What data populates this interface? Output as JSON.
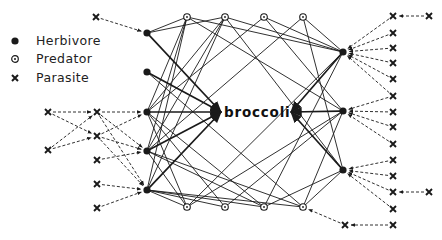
{
  "legend": {
    "items": [
      {
        "symbol": "filled-circle",
        "label": "Herbivore"
      },
      {
        "symbol": "circled-dot",
        "label": "Predator"
      },
      {
        "symbol": "cross",
        "label": "Parasite"
      }
    ]
  },
  "center": {
    "label": "broccoli",
    "x": 260,
    "y": 113
  },
  "colors": {
    "ink": "#1a1a1a",
    "background": "#ffffff"
  },
  "nodes": {
    "herbivores": [
      {
        "id": "H1",
        "x": 147,
        "y": 33
      },
      {
        "id": "H2",
        "x": 147,
        "y": 72
      },
      {
        "id": "H3",
        "x": 147,
        "y": 112
      },
      {
        "id": "H4",
        "x": 147,
        "y": 151
      },
      {
        "id": "H5",
        "x": 147,
        "y": 190
      },
      {
        "id": "H6",
        "x": 343,
        "y": 52
      },
      {
        "id": "H7",
        "x": 343,
        "y": 111
      },
      {
        "id": "H8",
        "x": 343,
        "y": 170
      }
    ],
    "predators": [
      {
        "id": "P1",
        "x": 187,
        "y": 17
      },
      {
        "id": "P2",
        "x": 225,
        "y": 17
      },
      {
        "id": "P3",
        "x": 264,
        "y": 17
      },
      {
        "id": "P4",
        "x": 303,
        "y": 17
      },
      {
        "id": "P5",
        "x": 187,
        "y": 207
      },
      {
        "id": "P6",
        "x": 225,
        "y": 207
      },
      {
        "id": "P7",
        "x": 264,
        "y": 207
      },
      {
        "id": "P8",
        "x": 303,
        "y": 207
      }
    ],
    "parasites": [
      {
        "id": "X1",
        "x": 96,
        "y": 17
      },
      {
        "id": "X2",
        "x": 48,
        "y": 112
      },
      {
        "id": "X3",
        "x": 97,
        "y": 112
      },
      {
        "id": "X4",
        "x": 48,
        "y": 150
      },
      {
        "id": "X5",
        "x": 97,
        "y": 136
      },
      {
        "id": "X6",
        "x": 97,
        "y": 160
      },
      {
        "id": "X7",
        "x": 97,
        "y": 184
      },
      {
        "id": "X8",
        "x": 97,
        "y": 208
      },
      {
        "id": "X9",
        "x": 393,
        "y": 16
      },
      {
        "id": "X10",
        "x": 429,
        "y": 16
      },
      {
        "id": "X11",
        "x": 393,
        "y": 33
      },
      {
        "id": "X12",
        "x": 393,
        "y": 48
      },
      {
        "id": "X13",
        "x": 393,
        "y": 63
      },
      {
        "id": "X14",
        "x": 393,
        "y": 79
      },
      {
        "id": "X15",
        "x": 393,
        "y": 96
      },
      {
        "id": "X16",
        "x": 393,
        "y": 112
      },
      {
        "id": "X17",
        "x": 393,
        "y": 127
      },
      {
        "id": "X18",
        "x": 393,
        "y": 144
      },
      {
        "id": "X19",
        "x": 393,
        "y": 160
      },
      {
        "id": "X20",
        "x": 393,
        "y": 176
      },
      {
        "id": "X21",
        "x": 393,
        "y": 192
      },
      {
        "id": "X22",
        "x": 429,
        "y": 192
      },
      {
        "id": "X23",
        "x": 393,
        "y": 209
      },
      {
        "id": "X24",
        "x": 393,
        "y": 225
      },
      {
        "id": "X25",
        "x": 345,
        "y": 225
      }
    ]
  },
  "edges": {
    "feeding": [
      [
        "H1",
        "center"
      ],
      [
        "H2",
        "center"
      ],
      [
        "H3",
        "center"
      ],
      [
        "H4",
        "center"
      ],
      [
        "H5",
        "center"
      ],
      [
        "H6",
        "center"
      ],
      [
        "H7",
        "center"
      ],
      [
        "H8",
        "center"
      ]
    ],
    "predation": [
      [
        "P1",
        "H1"
      ],
      [
        "P1",
        "H3"
      ],
      [
        "P1",
        "H4"
      ],
      [
        "P1",
        "H5"
      ],
      [
        "P1",
        "H6"
      ],
      [
        "P1",
        "H7"
      ],
      [
        "P2",
        "H1"
      ],
      [
        "P2",
        "H3"
      ],
      [
        "P2",
        "H4"
      ],
      [
        "P2",
        "H5"
      ],
      [
        "P2",
        "H6"
      ],
      [
        "P2",
        "H8"
      ],
      [
        "P3",
        "H6"
      ],
      [
        "P3",
        "H7"
      ],
      [
        "P3",
        "H3"
      ],
      [
        "P4",
        "H6"
      ],
      [
        "P4",
        "H8"
      ],
      [
        "P4",
        "H4"
      ],
      [
        "P5",
        "H3"
      ],
      [
        "P5",
        "H4"
      ],
      [
        "P5",
        "H5"
      ],
      [
        "P5",
        "H6"
      ],
      [
        "P5",
        "H7"
      ],
      [
        "P6",
        "H5"
      ],
      [
        "P6",
        "H7"
      ],
      [
        "P6",
        "H3"
      ],
      [
        "P7",
        "H3"
      ],
      [
        "P7",
        "H4"
      ],
      [
        "P7",
        "H5"
      ],
      [
        "P7",
        "H6"
      ],
      [
        "P7",
        "H8"
      ],
      [
        "P8",
        "H4"
      ],
      [
        "P8",
        "H5"
      ],
      [
        "P8",
        "H7"
      ],
      [
        "P8",
        "H8"
      ],
      [
        "P8",
        "H2"
      ]
    ],
    "parasitism": [
      [
        "X1",
        "H1"
      ],
      [
        "X2",
        "X3"
      ],
      [
        "X2",
        "X5"
      ],
      [
        "X4",
        "X3"
      ],
      [
        "X4",
        "X5"
      ],
      [
        "X3",
        "H3"
      ],
      [
        "X3",
        "H4"
      ],
      [
        "X3",
        "H5"
      ],
      [
        "X5",
        "H3"
      ],
      [
        "X5",
        "H4"
      ],
      [
        "X5",
        "H5"
      ],
      [
        "X6",
        "H4"
      ],
      [
        "X7",
        "H5"
      ],
      [
        "X8",
        "H5"
      ],
      [
        "X10",
        "X9"
      ],
      [
        "X9",
        "H6"
      ],
      [
        "X11",
        "H6"
      ],
      [
        "X12",
        "H6"
      ],
      [
        "X13",
        "H6"
      ],
      [
        "X14",
        "H6"
      ],
      [
        "X15",
        "H6"
      ],
      [
        "X15",
        "H7"
      ],
      [
        "X16",
        "H7"
      ],
      [
        "X17",
        "H7"
      ],
      [
        "X18",
        "H7"
      ],
      [
        "X19",
        "H8"
      ],
      [
        "X20",
        "H8"
      ],
      [
        "X21",
        "H8"
      ],
      [
        "X23",
        "H8"
      ],
      [
        "X22",
        "X21"
      ],
      [
        "X24",
        "X25"
      ],
      [
        "X25",
        "P8"
      ]
    ]
  }
}
